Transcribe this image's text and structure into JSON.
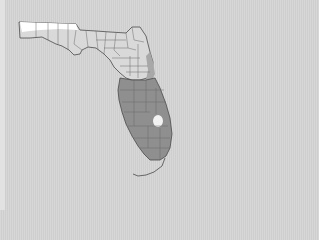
{
  "map": {
    "title": "",
    "subject": "Florida counties",
    "legend": [],
    "regions": [
      {
        "name": "panhandle-north-strip",
        "shade": "white",
        "color": "#ffffff"
      },
      {
        "name": "north-central-florida",
        "shade": "light-gray",
        "color": "#d9d9d9"
      },
      {
        "name": "east-coast-transition",
        "shade": "medium-gray",
        "color": "#a8a8a8"
      },
      {
        "name": "south-florida",
        "shade": "dark-gray",
        "color": "#8f8f8f"
      },
      {
        "name": "lake-okeechobee",
        "shade": "white",
        "color": "#f2f2f2"
      }
    ],
    "colors": {
      "background": "#d2d2d2",
      "outline": "#4a4a4a",
      "county_borders": "#6a6a6a"
    }
  }
}
